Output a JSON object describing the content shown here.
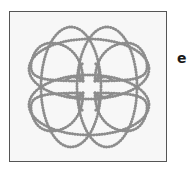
{
  "figure": {
    "panel_label": "e",
    "colors": {
      "background": "#f7f7f7",
      "border": "#555555",
      "curve": "#8c8c8c",
      "label": "#1a1a1a"
    }
  }
}
